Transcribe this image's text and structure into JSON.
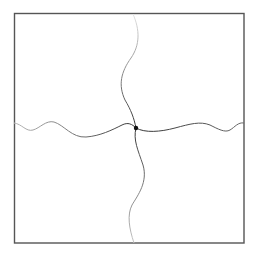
{
  "diagram": {
    "frame": {
      "x": 14,
      "y": 13,
      "width": 230,
      "height": 230,
      "stroke": "#555555"
    },
    "junction": {
      "x": 136,
      "y": 128,
      "radius": 2.2,
      "fill": "#111111"
    },
    "curves": [
      {
        "id": "top",
        "path": "M133,14 C140,30 140,45 131,58 C121,72 118,85 125,100 C131,110 134,118 136,128",
        "color_start": "#dddddd",
        "color_end": "#333333"
      },
      {
        "id": "bottom",
        "path": "M136,128 C133,140 138,150 143,165 C148,182 138,195 132,205 C127,215 129,228 134,243",
        "color_start": "#333333",
        "color_end": "#cccccc"
      },
      {
        "id": "left",
        "path": "M14,123 C22,124 26,132 33,130 C40,128 46,120 54,122 C64,125 72,138 86,137 C100,136 112,130 122,125 C128,122 132,124 136,128",
        "color_start": "#bbbbbb",
        "color_end": "#333333"
      },
      {
        "id": "right",
        "path": "M136,128 C145,133 160,132 175,128 C190,124 200,121 210,125 C218,129 225,133 230,130 C235,127 238,122 244,123",
        "color_start": "#333333",
        "color_end": "#777777"
      }
    ]
  }
}
